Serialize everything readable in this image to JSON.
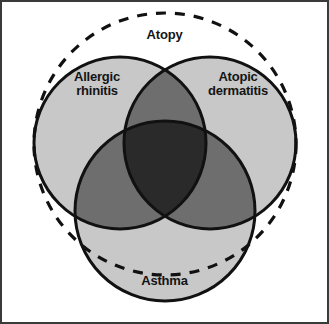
{
  "figure": {
    "type": "venn-diagram",
    "background_color": "#ffffff",
    "frame_color": "#3a3a3a",
    "label_color": "#141414"
  },
  "sets": [
    {
      "id": "allergic-rhinitis",
      "label": "Allergic\nrhinitis",
      "style": "solid",
      "fill_color": "#c8c8c8",
      "stroke_color": "#111111",
      "cx": 118,
      "cy": 141,
      "r": 86
    },
    {
      "id": "atopic-dermatitis",
      "label": "Atopic\ndermatitis",
      "style": "solid",
      "fill_color": "#c8c8c8",
      "stroke_color": "#111111",
      "cx": 208,
      "cy": 141,
      "r": 86
    },
    {
      "id": "asthma",
      "label": "Asthma",
      "style": "solid",
      "fill_color": "#c8c8c8",
      "stroke_color": "#111111",
      "cx": 163,
      "cy": 209,
      "r": 90
    }
  ],
  "enclosure": {
    "id": "atopy",
    "label": "Atopy",
    "style": "dashed",
    "stroke_color": "#111111",
    "fill": "none",
    "cx": 163,
    "cy": 142,
    "r": 131
  },
  "overlaps": {
    "single_fill": "#c8c8c8",
    "double_fill": "#6e6e6e",
    "triple_fill": "#2a2a2a"
  }
}
